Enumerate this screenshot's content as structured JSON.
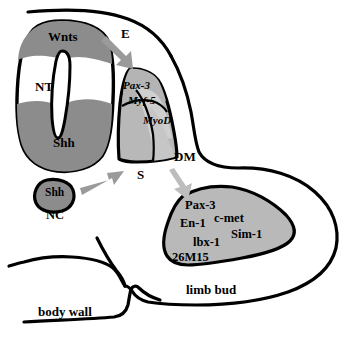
{
  "figure": {
    "background": "#ffffff",
    "stroke": "#000000"
  },
  "colors": {
    "outline": "#000000",
    "neural_tube_fill": "#ffffff",
    "signal_domain_fill": "#8c8c8c",
    "notochord_fill": "#8c8c8c",
    "somite_pax3_fill": "#b4b4b4",
    "somite_myf5_fill": "#cccccc",
    "somite_myod_fill": "#c4c4c4",
    "somite_body_fill": "#b8b8b8",
    "limb_bud_fill": "#b9b9b9",
    "arrow_fill": "#9a9a9a"
  },
  "structures": {
    "neural_tube": {
      "abbrev": "NT",
      "domains": [
        {
          "name": "Wnts",
          "position": "dorsal"
        },
        {
          "name": "Shh",
          "position": "ventral"
        }
      ]
    },
    "notochord": {
      "abbrev": "NC",
      "domains": [
        {
          "name": "Shh",
          "position": "whole"
        }
      ]
    },
    "somite": {
      "abbrev": "S",
      "domains": [
        {
          "name": "Pax-3",
          "position": "dorsomedial"
        },
        {
          "name": "Myf-5",
          "position": "medial"
        },
        {
          "name": "MyoD",
          "position": "lateral"
        }
      ]
    },
    "dermomyotome": {
      "abbrev": "DM"
    },
    "ectoderm": {
      "abbrev": "E"
    },
    "limb_bud": {
      "label": "limb bud",
      "genes": [
        "Pax-3",
        "En-1",
        "c-met",
        "lbx-1",
        "Sim-1",
        "26M15"
      ]
    },
    "body_wall": {
      "label": "body wall"
    }
  },
  "labels": {
    "wnts": "Wnts",
    "nt": "NT",
    "shh_nt": "Shh",
    "shh_nc": "Shh",
    "nc": "NC",
    "e": "E",
    "pax3_somite": "Pax-3",
    "myf5": "Myf-5",
    "myod": "MyoD",
    "s": "S",
    "dm": "DM",
    "pax3_limb": "Pax-3",
    "en1": "En-1",
    "cmet": "c-met",
    "lbx1": "lbx-1",
    "sim1": "Sim-1",
    "m26m15": "26M15",
    "limb_bud": "limb bud",
    "body_wall": "body wall"
  },
  "arrows": [
    {
      "name": "wnts-to-somite",
      "from": "neural tube dorsal (Wnts)",
      "to": "somite",
      "label": "E"
    },
    {
      "name": "notochord-to-somite",
      "from": "notochord (Shh)",
      "to": "somite",
      "label": "S"
    },
    {
      "name": "somite-to-limbbud",
      "from": "dermomyotome (DM)",
      "to": "limb bud",
      "label": "DM"
    }
  ]
}
